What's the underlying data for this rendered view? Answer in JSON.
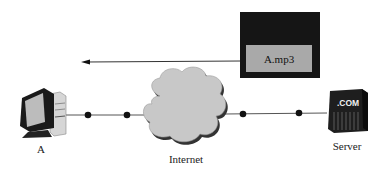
{
  "diagram": {
    "nodes": {
      "client": {
        "label": "A",
        "icon": "desktop-computer-icon"
      },
      "internet": {
        "label": "Internet",
        "icon": "cloud-icon"
      },
      "server": {
        "label": "Server",
        "icon": "server-icon",
        "badge": ".COM"
      }
    },
    "file": {
      "label": "A.mp3"
    },
    "arrow": {
      "direction": "right-to-left",
      "from": "file",
      "to": "client"
    },
    "link_dots": [
      88,
      127,
      243,
      299
    ],
    "colors": {
      "line": "#555555",
      "dot": "#111111",
      "file_outer": "#151515",
      "file_inner": "#a9a9a9",
      "cloud": "#c8c8c8",
      "cloud_shadow": "#333333",
      "server": "#1e1e1e"
    }
  }
}
